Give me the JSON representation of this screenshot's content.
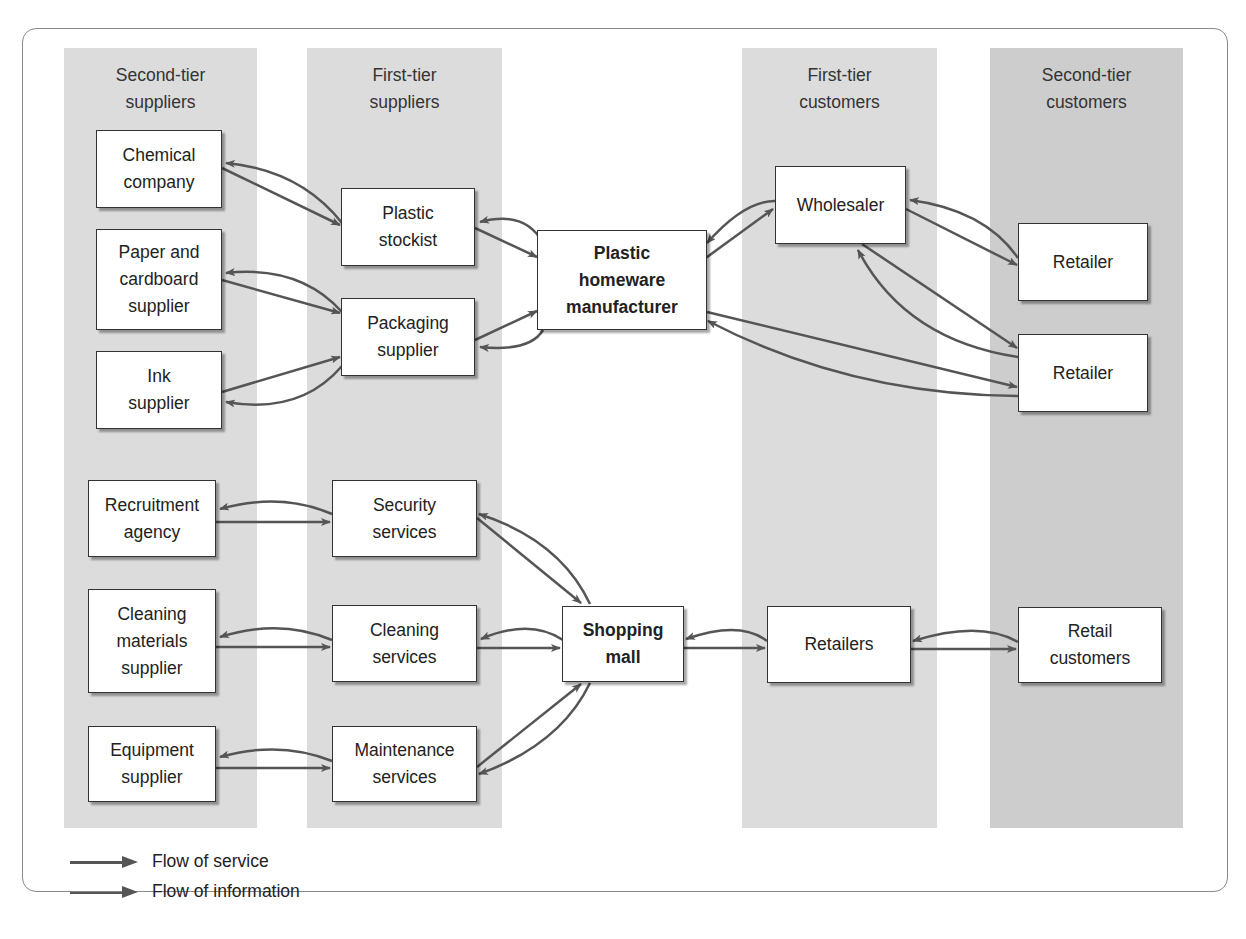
{
  "columns": [
    {
      "id": "second-tier-suppliers",
      "line1": "Second-tier",
      "line2": "suppliers"
    },
    {
      "id": "first-tier-suppliers",
      "line1": "First-tier",
      "line2": "suppliers"
    },
    {
      "id": "first-tier-customers",
      "line1": "First-tier",
      "line2": "customers"
    },
    {
      "id": "second-tier-customers",
      "line1": "Second-tier",
      "line2": "customers"
    }
  ],
  "nodes": {
    "chemical_company": [
      "Chemical",
      "company"
    ],
    "paper_supplier": [
      "Paper and",
      "cardboard",
      "supplier"
    ],
    "ink_supplier": [
      "Ink",
      "supplier"
    ],
    "plastic_stockist": [
      "Plastic",
      "stockist"
    ],
    "packaging_supplier": [
      "Packaging",
      "supplier"
    ],
    "manufacturer": [
      "Plastic",
      "homeware",
      "manufacturer"
    ],
    "wholesaler": [
      "Wholesaler"
    ],
    "retailer_1": [
      "Retailer"
    ],
    "retailer_2": [
      "Retailer"
    ],
    "recruitment_agency": [
      "Recruitment",
      "agency"
    ],
    "cleaning_materials_supplier": [
      "Cleaning",
      "materials",
      "supplier"
    ],
    "equipment_supplier": [
      "Equipment",
      "supplier"
    ],
    "security_services": [
      "Security",
      "services"
    ],
    "cleaning_services": [
      "Cleaning",
      "services"
    ],
    "maintenance_services": [
      "Maintenance",
      "services"
    ],
    "shopping_mall": [
      "Shopping",
      "mall"
    ],
    "retailers": [
      "Retailers"
    ],
    "retail_customers": [
      "Retail",
      "customers"
    ]
  },
  "edges": [
    {
      "from": "chemical_company",
      "to": "plastic_stockist",
      "type": "service"
    },
    {
      "from": "plastic_stockist",
      "to": "chemical_company",
      "type": "information"
    },
    {
      "from": "paper_supplier",
      "to": "packaging_supplier",
      "type": "service"
    },
    {
      "from": "packaging_supplier",
      "to": "paper_supplier",
      "type": "information"
    },
    {
      "from": "ink_supplier",
      "to": "packaging_supplier",
      "type": "service"
    },
    {
      "from": "packaging_supplier",
      "to": "ink_supplier",
      "type": "information"
    },
    {
      "from": "plastic_stockist",
      "to": "manufacturer",
      "type": "service"
    },
    {
      "from": "manufacturer",
      "to": "plastic_stockist",
      "type": "information"
    },
    {
      "from": "packaging_supplier",
      "to": "manufacturer",
      "type": "service"
    },
    {
      "from": "manufacturer",
      "to": "packaging_supplier",
      "type": "information"
    },
    {
      "from": "manufacturer",
      "to": "wholesaler",
      "type": "service"
    },
    {
      "from": "wholesaler",
      "to": "manufacturer",
      "type": "information"
    },
    {
      "from": "wholesaler",
      "to": "retailer_1",
      "type": "service"
    },
    {
      "from": "retailer_1",
      "to": "wholesaler",
      "type": "information"
    },
    {
      "from": "wholesaler",
      "to": "retailer_2",
      "type": "service"
    },
    {
      "from": "retailer_2",
      "to": "wholesaler",
      "type": "information"
    },
    {
      "from": "manufacturer",
      "to": "retailer_2",
      "type": "service"
    },
    {
      "from": "retailer_2",
      "to": "manufacturer",
      "type": "information"
    },
    {
      "from": "recruitment_agency",
      "to": "security_services",
      "type": "service"
    },
    {
      "from": "security_services",
      "to": "recruitment_agency",
      "type": "information"
    },
    {
      "from": "cleaning_materials_supplier",
      "to": "cleaning_services",
      "type": "service"
    },
    {
      "from": "cleaning_services",
      "to": "cleaning_materials_supplier",
      "type": "information"
    },
    {
      "from": "equipment_supplier",
      "to": "maintenance_services",
      "type": "service"
    },
    {
      "from": "maintenance_services",
      "to": "equipment_supplier",
      "type": "information"
    },
    {
      "from": "security_services",
      "to": "shopping_mall",
      "type": "service"
    },
    {
      "from": "shopping_mall",
      "to": "security_services",
      "type": "information"
    },
    {
      "from": "cleaning_services",
      "to": "shopping_mall",
      "type": "service"
    },
    {
      "from": "shopping_mall",
      "to": "cleaning_services",
      "type": "information"
    },
    {
      "from": "maintenance_services",
      "to": "shopping_mall",
      "type": "service"
    },
    {
      "from": "shopping_mall",
      "to": "maintenance_services",
      "type": "information"
    },
    {
      "from": "shopping_mall",
      "to": "retailers",
      "type": "service"
    },
    {
      "from": "retailers",
      "to": "shopping_mall",
      "type": "information"
    },
    {
      "from": "retailers",
      "to": "retail_customers",
      "type": "service"
    },
    {
      "from": "retail_customers",
      "to": "retailers",
      "type": "information"
    }
  ],
  "legend": {
    "service": "Flow of service",
    "information": "Flow of information"
  },
  "colors": {
    "band_light": "#dcdcdc",
    "band_dark": "#cdcdcd",
    "arrow": "#555555",
    "box_border": "#333333"
  }
}
